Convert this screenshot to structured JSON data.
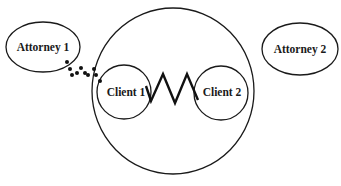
{
  "diagram": {
    "nodes": [
      {
        "id": "attorney1",
        "label": "Attorney 1",
        "shape": "ellipse",
        "cx": 43,
        "cy": 47,
        "rx": 37,
        "ry": 25
      },
      {
        "id": "attorney2",
        "label": "Attorney 2",
        "shape": "ellipse",
        "cx": 300,
        "cy": 49,
        "rx": 38,
        "ry": 26
      },
      {
        "id": "outer",
        "label": "",
        "shape": "ellipse",
        "cx": 173,
        "cy": 91,
        "rx": 81,
        "ry": 83
      },
      {
        "id": "client1",
        "label": "Client 1",
        "shape": "circle",
        "cx": 124,
        "cy": 92,
        "r": 27
      },
      {
        "id": "client2",
        "label": "Client 2",
        "shape": "circle",
        "cx": 221,
        "cy": 93,
        "r": 27
      }
    ],
    "edges": [
      {
        "from": "attorney1",
        "to": "client1",
        "style": "dotted"
      },
      {
        "from": "client1",
        "to": "client2",
        "style": "zigzag"
      }
    ],
    "colors": {
      "stroke": "#1a1a1a",
      "background": "#ffffff"
    }
  },
  "labels": {
    "attorney1": "Attorney 1",
    "attorney2": "Attorney 2",
    "client1": "Client 1",
    "client2": "Client 2"
  }
}
